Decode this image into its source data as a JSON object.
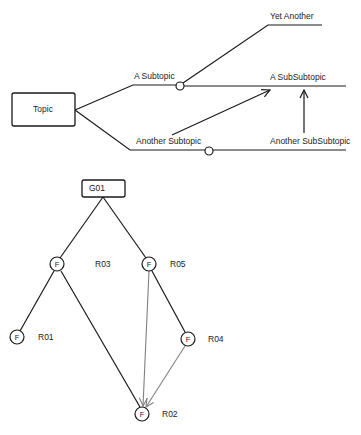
{
  "mindmap": {
    "root": {
      "label": "Topic"
    },
    "branches": [
      {
        "label": "A Subtopic"
      },
      {
        "label": "Another Subtopic"
      }
    ],
    "sub_branches": [
      {
        "label": "Yet Another"
      },
      {
        "label": "A SubSubtopic"
      },
      {
        "label": "Another SubSubtopic"
      }
    ]
  },
  "tree": {
    "root": {
      "label": "G01"
    },
    "node_glyph": "F",
    "nodes": [
      {
        "id": "R03",
        "label": "R03",
        "glyph": "F"
      },
      {
        "id": "R05",
        "label": "R05",
        "glyph": "F"
      },
      {
        "id": "R01",
        "label": "R01",
        "glyph": "F"
      },
      {
        "id": "R04",
        "label": "R04",
        "glyph": "F"
      },
      {
        "id": "R02",
        "label": "R02",
        "glyph": "F"
      }
    ],
    "edges": [
      {
        "from": "G01",
        "to": "R03",
        "style": "solid-black"
      },
      {
        "from": "G01",
        "to": "R05",
        "style": "solid-black"
      },
      {
        "from": "R03",
        "to": "R01",
        "style": "solid-black"
      },
      {
        "from": "R03",
        "to": "R02",
        "style": "solid-black"
      },
      {
        "from": "R05",
        "to": "R04",
        "style": "solid-black"
      },
      {
        "from": "R05",
        "to": "R02",
        "style": "gray-arrow"
      },
      {
        "from": "R04",
        "to": "R02",
        "style": "gray-arrow"
      }
    ]
  },
  "colors": {
    "line": "#1a1a1a",
    "secondary_line": "#808080",
    "background": "#ffffff"
  }
}
